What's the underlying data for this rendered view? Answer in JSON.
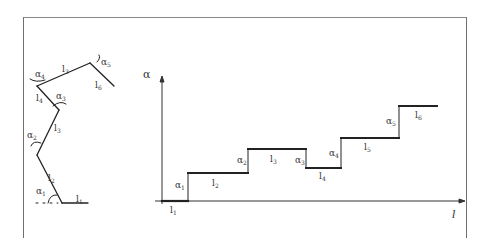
{
  "diagram": {
    "type": "hand-drawn schematic",
    "left_figure": {
      "description": "polyline of six segments with joint angles",
      "segment_labels": [
        "l1",
        "l2",
        "l3",
        "l4",
        "l3",
        "l6"
      ],
      "angle_labels": [
        "α1",
        "α2",
        "α3",
        "α4",
        "α5"
      ],
      "labels": {
        "l1": "l",
        "l1_sub": "1",
        "l2": "l",
        "l2_sub": "2",
        "l3": "l",
        "l3_sub": "3",
        "l4": "l",
        "l4_sub": "4",
        "l5": "l",
        "l5_sub": "3",
        "l6": "l",
        "l6_sub": "6",
        "a1": "α",
        "a1_sub": "1",
        "a2": "α",
        "a2_sub": "2",
        "a3": "α",
        "a3_sub": "3",
        "a4": "α",
        "a4_sub": "4",
        "a5": "α",
        "a5_sub": "5"
      }
    },
    "right_figure": {
      "description": "step plot of angle α versus length l",
      "y_axis_label": "α",
      "x_axis_label": "l",
      "steps": [
        {
          "segment": "l1",
          "level": 0
        },
        {
          "segment": "l2",
          "level": 1,
          "rise_label": "α1"
        },
        {
          "segment": "l3",
          "level": 2,
          "rise_label": "α2"
        },
        {
          "segment": "l4",
          "level": 1.2,
          "drop_label": "α3"
        },
        {
          "segment": "l5",
          "level": 2.5,
          "rise_label": "α4"
        },
        {
          "segment": "l6",
          "level": 3.6,
          "rise_label": "α5"
        }
      ],
      "labels": {
        "l1": "l",
        "l1_sub": "1",
        "l2": "l",
        "l2_sub": "2",
        "l3": "l",
        "l3_sub": "3",
        "l4": "l",
        "l4_sub": "4",
        "l5": "l",
        "l5_sub": "5",
        "l6": "l",
        "l6_sub": "6",
        "a1": "α",
        "a1_sub": "1",
        "a2": "α",
        "a2_sub": "2",
        "a3": "α",
        "a3_sub": "3",
        "a4": "α",
        "a4_sub": "4",
        "a5": "α",
        "a5_sub": "5"
      }
    }
  }
}
